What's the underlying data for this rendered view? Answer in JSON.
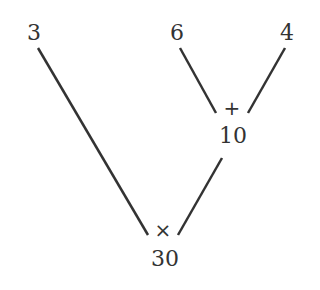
{
  "diagram": {
    "type": "expression-tree",
    "leaves": [
      {
        "id": "leaf-3",
        "value": "3"
      },
      {
        "id": "leaf-6",
        "value": "6"
      },
      {
        "id": "leaf-4",
        "value": "4"
      }
    ],
    "nodes": [
      {
        "id": "add-node",
        "operator": "+",
        "result": "10",
        "children": [
          "leaf-6",
          "leaf-4"
        ]
      },
      {
        "id": "mul-node",
        "operator": "×",
        "result": "30",
        "children": [
          "leaf-3",
          "add-node"
        ]
      }
    ],
    "line_color": "#333333"
  }
}
